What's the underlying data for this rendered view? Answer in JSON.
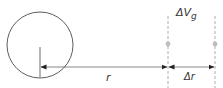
{
  "diagram": {
    "labels": {
      "radius": "r",
      "delta_r": "Δr",
      "delta_v_prefix": "ΔV",
      "delta_v_subscript": "g"
    },
    "colors": {
      "stroke": "#4a4a4a",
      "dashed": "#9a9a9a",
      "dot": "#bdbdbd",
      "text": "#333333"
    }
  }
}
